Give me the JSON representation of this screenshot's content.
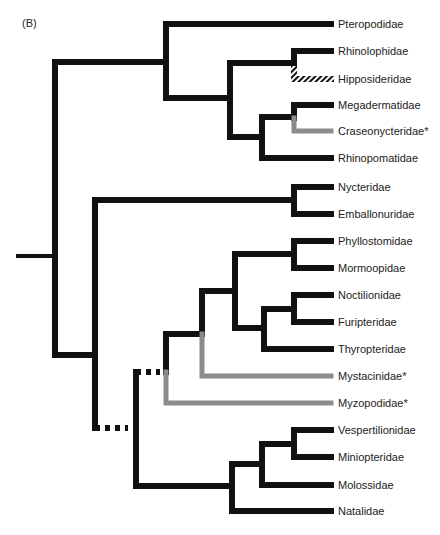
{
  "panel_label": "(B)",
  "colors": {
    "branch": "#111111",
    "gray_branch": "#8c8c8c",
    "hatched": "#111111"
  },
  "leaves": [
    {
      "name": "Pteropodidae",
      "y": 24
    },
    {
      "name": "Rhinolophidae",
      "y": 51
    },
    {
      "name": "Hipposideridae",
      "y": 79
    },
    {
      "name": "Megadermatidae",
      "y": 105
    },
    {
      "name": "Craseonycteridae*",
      "y": 131
    },
    {
      "name": "Rhinopomatidae",
      "y": 158
    },
    {
      "name": "Nycteridae",
      "y": 187
    },
    {
      "name": "Emballonuridae",
      "y": 214
    },
    {
      "name": "Phyllostomidae",
      "y": 241
    },
    {
      "name": "Mormoopidae",
      "y": 268
    },
    {
      "name": "Noctilionidae",
      "y": 295
    },
    {
      "name": "Furipteridae",
      "y": 322
    },
    {
      "name": "Thyropteridae",
      "y": 349
    },
    {
      "name": "Mystacinidae*",
      "y": 376
    },
    {
      "name": "Myzopodidae*",
      "y": 403
    },
    {
      "name": "Vespertilionidae",
      "y": 430
    },
    {
      "name": "Miniopteridae",
      "y": 457
    },
    {
      "name": "Molossidae",
      "y": 485
    },
    {
      "name": "Natalidae",
      "y": 511
    }
  ],
  "segments": [
    {
      "d": "M18 256 H55",
      "style": "root"
    },
    {
      "d": "M55 62 V355",
      "style": "black"
    },
    {
      "d": "M55 62 H166",
      "style": "black"
    },
    {
      "d": "M166 24 V98",
      "style": "black"
    },
    {
      "d": "M166 24 H331",
      "style": "black"
    },
    {
      "d": "M166 98 H230",
      "style": "black"
    },
    {
      "d": "M230 63 V137",
      "style": "black"
    },
    {
      "d": "M230 63 H294",
      "style": "black"
    },
    {
      "d": "M294 51 V63",
      "style": "black"
    },
    {
      "d": "M294 51 H331",
      "style": "black"
    },
    {
      "d": "M294 63 V79 H331",
      "style": "hatched"
    },
    {
      "d": "M230 137 H262",
      "style": "black"
    },
    {
      "d": "M262 117 V158",
      "style": "black"
    },
    {
      "d": "M262 158 H331",
      "style": "black"
    },
    {
      "d": "M262 117 H294",
      "style": "black"
    },
    {
      "d": "M294 105 V118",
      "style": "black"
    },
    {
      "d": "M294 105 H331",
      "style": "black"
    },
    {
      "d": "M294 118 V131 H331",
      "style": "gray"
    },
    {
      "d": "M55 355 H95",
      "style": "black"
    },
    {
      "d": "M95 200 V428",
      "style": "black"
    },
    {
      "d": "M95 200 H294",
      "style": "black"
    },
    {
      "d": "M294 187 V214",
      "style": "black"
    },
    {
      "d": "M294 187 H331",
      "style": "black"
    },
    {
      "d": "M294 214 H331",
      "style": "black"
    },
    {
      "d": "M95 428 H128",
      "style": "dotted"
    },
    {
      "d": "M136 372 V486",
      "style": "black"
    },
    {
      "d": "M136 372 H160",
      "style": "dotted"
    },
    {
      "d": "M166 334 V372",
      "style": "black"
    },
    {
      "d": "M166 372 V403 H331",
      "style": "gray"
    },
    {
      "d": "M166 334 H202",
      "style": "black"
    },
    {
      "d": "M202 291 V334",
      "style": "black"
    },
    {
      "d": "M202 334 V376 H331",
      "style": "gray"
    },
    {
      "d": "M202 291 H235",
      "style": "black"
    },
    {
      "d": "M235 254 V328",
      "style": "black"
    },
    {
      "d": "M235 254 H294",
      "style": "black"
    },
    {
      "d": "M294 241 V268",
      "style": "black"
    },
    {
      "d": "M294 241 H331",
      "style": "black"
    },
    {
      "d": "M294 268 H331",
      "style": "black"
    },
    {
      "d": "M235 328 H264",
      "style": "black"
    },
    {
      "d": "M264 309 V349",
      "style": "black"
    },
    {
      "d": "M264 349 H331",
      "style": "black"
    },
    {
      "d": "M264 309 H294",
      "style": "black"
    },
    {
      "d": "M294 295 V322",
      "style": "black"
    },
    {
      "d": "M294 295 H331",
      "style": "black"
    },
    {
      "d": "M294 322 H331",
      "style": "black"
    },
    {
      "d": "M136 486 H232",
      "style": "black"
    },
    {
      "d": "M232 464 V511",
      "style": "black"
    },
    {
      "d": "M232 511 H331",
      "style": "black"
    },
    {
      "d": "M232 464 H262",
      "style": "black"
    },
    {
      "d": "M262 444 V485",
      "style": "black"
    },
    {
      "d": "M262 485 H331",
      "style": "black"
    },
    {
      "d": "M262 444 H294",
      "style": "black"
    },
    {
      "d": "M294 430 V457",
      "style": "black"
    },
    {
      "d": "M294 430 H331",
      "style": "black"
    },
    {
      "d": "M294 457 H331",
      "style": "black"
    }
  ]
}
